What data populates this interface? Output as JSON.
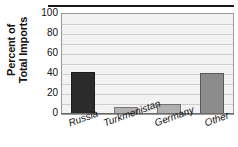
{
  "chart_data": {
    "type": "bar",
    "title": "",
    "xlabel": "",
    "ylabel": "Percent of Total Imports",
    "ylabel_line1": "Percent of",
    "ylabel_line2": "Total Imports",
    "categories": [
      "Russia",
      "Turkmenistan",
      "Germany",
      "Other"
    ],
    "values": [
      42,
      7,
      10,
      41
    ],
    "ylim": [
      0,
      100
    ],
    "yticks": [
      100,
      80,
      60,
      40,
      20,
      0
    ],
    "gridlines": [
      10,
      20,
      30,
      40,
      50,
      60,
      70,
      80,
      90
    ],
    "grid": true,
    "legend": "none",
    "bar_colors": [
      "#2b2b2b",
      "#b2b2b2",
      "#b0b0b0",
      "#8c8c8c"
    ],
    "plot_background": "#f2f2f2",
    "gridline_color": "#cfcfcf",
    "frame_color": "#9a9a9a"
  }
}
